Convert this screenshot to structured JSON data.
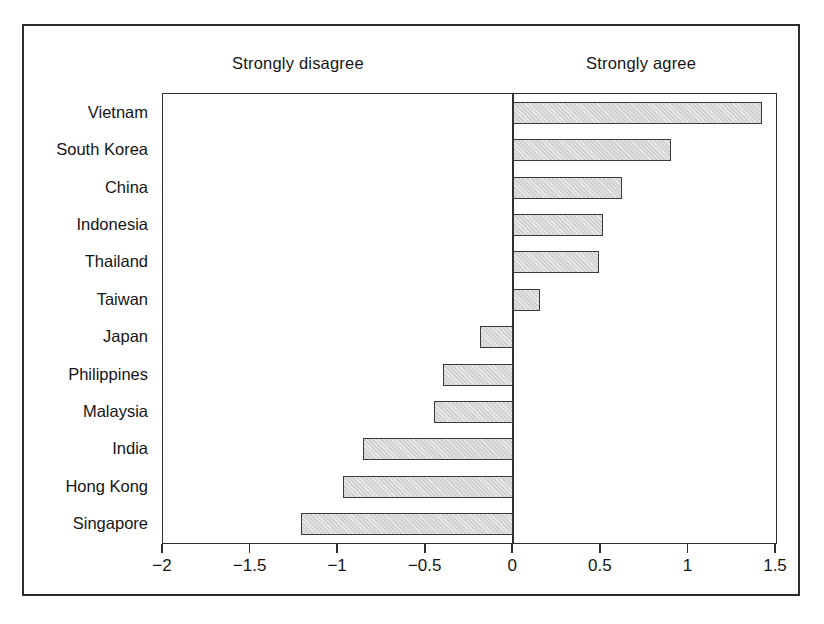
{
  "figure": {
    "anchor_left": "Strongly disagree",
    "anchor_right": "Strongly agree"
  },
  "axis": {
    "tick_labels": [
      "−2",
      "−1.5",
      "−1",
      "−0.5",
      "0",
      "0.5",
      "1",
      "1.5"
    ],
    "tick_values": [
      -2,
      -1.5,
      -1,
      -0.5,
      0,
      0.5,
      1,
      1.5
    ]
  },
  "chart_data": {
    "type": "bar",
    "orientation": "horizontal",
    "title": "",
    "subtitle": "",
    "xlabel": "",
    "ylabel": "",
    "xlim": [
      -2,
      1.5
    ],
    "xticks": [
      -2,
      -1.5,
      -1,
      -0.5,
      0,
      0.5,
      1,
      1.5
    ],
    "grid": false,
    "legend": null,
    "annotations": [
      {
        "text": "Strongly disagree",
        "position": "top-left"
      },
      {
        "text": "Strongly agree",
        "position": "top-right"
      }
    ],
    "bar_color": "#d2d2d2",
    "bar_edge_color": "#3a3a3a",
    "categories": [
      "Vietnam",
      "South Korea",
      "China",
      "Indonesia",
      "Thailand",
      "Taiwan",
      "Japan",
      "Philippines",
      "Malaysia",
      "India",
      "Hong Kong",
      "Singapore"
    ],
    "values": [
      1.42,
      0.9,
      0.62,
      0.51,
      0.49,
      0.15,
      -0.19,
      -0.4,
      -0.45,
      -0.86,
      -0.97,
      -1.21
    ]
  }
}
